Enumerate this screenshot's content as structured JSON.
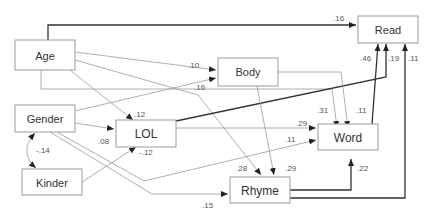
{
  "diagram": {
    "type": "path-model",
    "nodes": {
      "age": "Age",
      "read": "Read",
      "body": "Body",
      "gender": "Gender",
      "lol": "LOL",
      "word": "Word",
      "kinder": "Kinder",
      "rhyme": "Rhyme"
    },
    "edges": [
      {
        "id": "age-read",
        "from": "Age",
        "to": "Read",
        "coef": ".16",
        "weight": "strong"
      },
      {
        "id": "age-body",
        "from": "Age",
        "to": "Body",
        "coef": ".10",
        "weight": "weak"
      },
      {
        "id": "age-lol",
        "from": "Age",
        "to": "LOL",
        "coef": ".12",
        "weight": "weak"
      },
      {
        "id": "age-rhyme",
        "from": "Age",
        "to": "Rhyme",
        "coef": ".28",
        "weight": "weak"
      },
      {
        "id": "age-word",
        "from": "Age",
        "to": "Word",
        "coef": ".31",
        "weight": "weak"
      },
      {
        "id": "gender-body",
        "from": "Gender",
        "to": "Body",
        "coef": ".16",
        "weight": "weak"
      },
      {
        "id": "gender-lol",
        "from": "Gender",
        "to": "LOL",
        "coef": ".08",
        "weight": "weak"
      },
      {
        "id": "gender-word",
        "from": "Gender",
        "to": "Word",
        "coef": ".11",
        "weight": "weak"
      },
      {
        "id": "gender-rhyme",
        "from": "Gender",
        "to": "Rhyme",
        "coef": ".15",
        "weight": "weak"
      },
      {
        "id": "gender-kinder",
        "from": "Gender",
        "to": "Kinder",
        "coef": "-.14",
        "weight": "correlation"
      },
      {
        "id": "kinder-lol",
        "from": "Kinder",
        "to": "LOL",
        "coef": "-.12",
        "weight": "weak"
      },
      {
        "id": "lol-read",
        "from": "LOL",
        "to": "Read",
        "coef": ".19",
        "weight": "strong"
      },
      {
        "id": "lol-word",
        "from": "LOL",
        "to": "Word",
        "coef": ".29",
        "weight": "weak"
      },
      {
        "id": "body-word",
        "from": "Body",
        "to": "Word",
        "coef": ".11",
        "weight": "weak"
      },
      {
        "id": "body-rhyme",
        "from": "Body",
        "to": "Rhyme",
        "coef": ".29",
        "weight": "weak"
      },
      {
        "id": "word-read",
        "from": "Word",
        "to": "Read",
        "coef": ".46",
        "weight": "strong"
      },
      {
        "id": "rhyme-word",
        "from": "Rhyme",
        "to": "Word",
        "coef": ".22",
        "weight": "strong"
      },
      {
        "id": "rhyme-read",
        "from": "Rhyme",
        "to": "Read",
        "coef": ".11",
        "weight": "strong"
      }
    ]
  }
}
